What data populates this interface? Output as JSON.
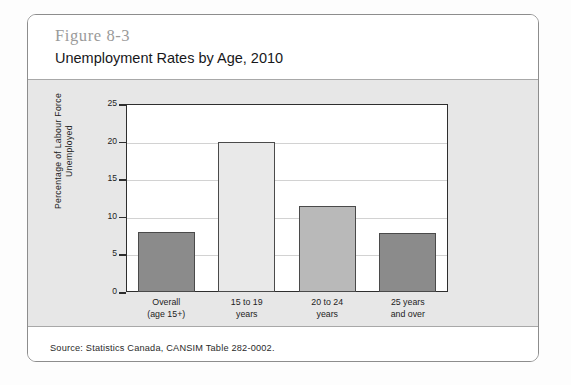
{
  "figure": {
    "number": "Figure 8-3",
    "title": "Unemployment Rates by Age, 2010",
    "source": "Source: Statistics Canada, CANSIM Table 282-0002."
  },
  "chart_data": {
    "type": "bar",
    "title": "Unemployment Rates by Age, 2010",
    "xlabel": "",
    "ylabel": "Percentage of Labour Force Unemployed",
    "ylabel_lines": [
      "Percentage of Labour Force",
      "Unemployed"
    ],
    "categories": [
      "Overall (age 15+)",
      "15 to 19 years",
      "20 to 24 years",
      "25 years and over"
    ],
    "category_lines": [
      [
        "Overall",
        "(age 15+)"
      ],
      [
        "15 to 19",
        "years"
      ],
      [
        "20 to 24",
        "years"
      ],
      [
        "25 years",
        "and over"
      ]
    ],
    "values": [
      8.0,
      19.9,
      11.4,
      7.9
    ],
    "ylim": [
      0,
      25
    ],
    "yticks": [
      0,
      5,
      10,
      15,
      20,
      25
    ],
    "ytick_labels": [
      "0",
      "5",
      "10",
      "15",
      "20",
      "25"
    ],
    "grid": true,
    "legend": "none",
    "bar_colors": [
      "#8b8b8b",
      "#e9e9e9",
      "#b9b9b9",
      "#8b8b8b"
    ],
    "bar_border_color": "#4a4a4a"
  },
  "colors": {
    "panel_background": "#e7e7e7",
    "plot_background": "#ffffff",
    "axis": "#2e2e2e",
    "gridline": "#d2d2d2",
    "figure_number": "#9a9a9a",
    "title_text": "#17171a",
    "card_border": "#8d8d8d"
  }
}
